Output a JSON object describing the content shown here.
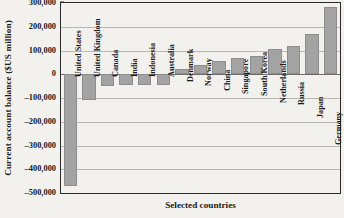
{
  "chart_data": {
    "type": "bar",
    "title": "",
    "xlabel": "Selected countries",
    "ylabel": "Current account balance ($US million)",
    "ylim": [
      -500000,
      300000
    ],
    "ytick_labels": [
      "300,000",
      "200,000",
      "100,000",
      "0",
      "–100,000",
      "–200,000",
      "–300,000",
      "–400,000",
      "–500,000"
    ],
    "ytick_values": [
      300000,
      200000,
      100000,
      0,
      -100000,
      -200000,
      -300000,
      -400000,
      -500000
    ],
    "grid": true,
    "legend": "none",
    "bar_color": "#a3a3a3",
    "categories": [
      "United States",
      "United Kingdom",
      "Canada",
      "India",
      "Indonesia",
      "Australia",
      "Denmark",
      "Norway",
      "China",
      "Singapore",
      "South Korea",
      "Netherlands",
      "Russia",
      "Japan",
      "Germany"
    ],
    "values": [
      -470000,
      -110000,
      -48000,
      -46000,
      -44000,
      -44000,
      22000,
      37000,
      57000,
      70000,
      77000,
      108000,
      118000,
      170000,
      285000
    ]
  }
}
